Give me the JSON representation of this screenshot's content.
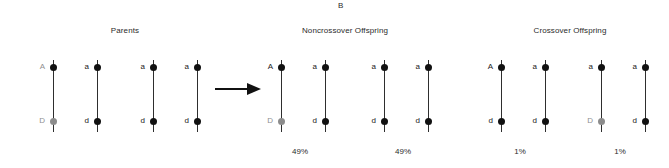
{
  "panel": {
    "letter": "B"
  },
  "headings": {
    "parents": "Parents",
    "noncrossover": "Noncrossover Offspring",
    "crossover": "Crossover Offspring"
  },
  "arrow": {
    "icon": "right-arrow-icon"
  },
  "groups": {
    "parent_1": {
      "left": {
        "top_allele": "A",
        "bottom_allele": "D"
      },
      "right": {
        "top_allele": "a",
        "bottom_allele": "d"
      }
    },
    "parent_2": {
      "left": {
        "top_allele": "a",
        "bottom_allele": "d"
      },
      "right": {
        "top_allele": "a",
        "bottom_allele": "d"
      }
    },
    "noncrossover_1": {
      "left": {
        "top_allele": "A",
        "bottom_allele": "D"
      },
      "right": {
        "top_allele": "a",
        "bottom_allele": "d"
      },
      "percent": "49%"
    },
    "noncrossover_2": {
      "left": {
        "top_allele": "a",
        "bottom_allele": "d"
      },
      "right": {
        "top_allele": "a",
        "bottom_allele": "d"
      },
      "percent": "49%"
    },
    "crossover_1": {
      "left": {
        "top_allele": "A",
        "bottom_allele": "d"
      },
      "right": {
        "top_allele": "a",
        "bottom_allele": "d"
      },
      "percent": "1%"
    },
    "crossover_2": {
      "left": {
        "top_allele": "a",
        "bottom_allele": "D"
      },
      "right": {
        "top_allele": "a",
        "bottom_allele": "d"
      },
      "percent": "1%"
    }
  },
  "chart_data": {
    "type": "diagram",
    "title": "B",
    "loci": [
      "A/a",
      "D/d"
    ],
    "sections": [
      "Parents",
      "Noncrossover Offspring",
      "Crossover Offspring"
    ],
    "categories": [
      "Noncrossover A D / a d",
      "Noncrossover a d / a d",
      "Crossover A d / a d",
      "Crossover a D / a d"
    ],
    "values": [
      49,
      49,
      1,
      1
    ],
    "value_labels": [
      "49%",
      "49%",
      "1%",
      "1%"
    ],
    "ylabel": "Offspring frequency (%)",
    "recombination_frequency": 2
  },
  "colors": {
    "line": "#2e2e2e",
    "dot": "#111111",
    "dot_muted": "#8c8c8c",
    "text": "#1a1a1a",
    "text_muted": "#8f8f8f",
    "background": "#ffffff"
  }
}
